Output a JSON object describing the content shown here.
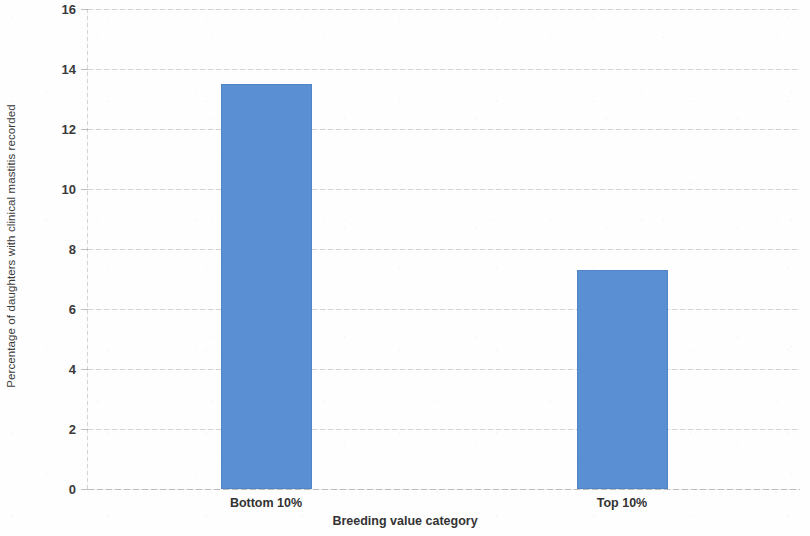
{
  "chart_data": {
    "type": "bar",
    "title": "",
    "subtitle": "",
    "xlabel": "Breeding value category",
    "ylabel": "Percentage of daughters with clinical mastitis recorded",
    "categories": [
      "Bottom 10%",
      "Top 10%"
    ],
    "values": [
      13.5,
      7.3
    ],
    "series": [
      {
        "name": "Percentage of daughters with clinical mastitis recorded",
        "values": [
          13.5,
          7.3
        ]
      }
    ],
    "ylim": [
      0,
      16
    ],
    "ytick_labels": [
      "0",
      "2",
      "4",
      "6",
      "8",
      "10",
      "12",
      "14",
      "16"
    ],
    "ytick_values": [
      0,
      2,
      4,
      6,
      8,
      10,
      12,
      14,
      16
    ],
    "ytick_step": 2,
    "xtick_labels": [
      "Bottom 10%",
      "Top 10%"
    ],
    "grid": "horizontal",
    "legend": "none",
    "bar_color": "#5b8fd4",
    "gridline_color": "#b4b4b9",
    "axis_text_color": "#333333",
    "background_color": "#fefefe",
    "annotations": []
  }
}
